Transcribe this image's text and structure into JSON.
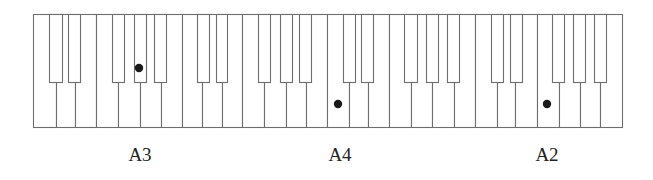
{
  "diagram": {
    "colors": {
      "background": "#ffffff",
      "key_fill": "#ffffff",
      "key_stroke": "#6e6e6e",
      "dot": "#1a1a1a",
      "label": "#222222"
    },
    "keyboard": {
      "top": 14,
      "bottom": 127,
      "black_key_bottom": 82,
      "white_key_edges": [
        33,
        56,
        75,
        96,
        118,
        140,
        161,
        182,
        202,
        222,
        242,
        264,
        286,
        306,
        327,
        349,
        368,
        389,
        411,
        432,
        454,
        475,
        497,
        515,
        537,
        559,
        580,
        600,
        622
      ],
      "black_keys": [
        {
          "x": 49,
          "w": 13
        },
        {
          "x": 68,
          "w": 12
        },
        {
          "x": 112,
          "w": 12
        },
        {
          "x": 134,
          "w": 12
        },
        {
          "x": 154,
          "w": 12
        },
        {
          "x": 197,
          "w": 12
        },
        {
          "x": 216,
          "w": 11
        },
        {
          "x": 258,
          "w": 12
        },
        {
          "x": 280,
          "w": 12
        },
        {
          "x": 299,
          "w": 12
        },
        {
          "x": 343,
          "w": 12
        },
        {
          "x": 361,
          "w": 12
        },
        {
          "x": 404,
          "w": 13
        },
        {
          "x": 426,
          "w": 12
        },
        {
          "x": 447,
          "w": 12
        },
        {
          "x": 491,
          "w": 12
        },
        {
          "x": 510,
          "w": 12
        },
        {
          "x": 552,
          "w": 12
        },
        {
          "x": 573,
          "w": 12
        },
        {
          "x": 594,
          "w": 12
        }
      ]
    },
    "markers": [
      {
        "name": "marker-dot-a3",
        "cx": 139,
        "cy": 68,
        "r": 4.2
      },
      {
        "name": "marker-dot-a4",
        "cx": 338,
        "cy": 104,
        "r": 4.2
      },
      {
        "name": "marker-dot-a2",
        "cx": 547,
        "cy": 104,
        "r": 4.2
      }
    ],
    "labels": [
      {
        "text": "A3",
        "x": 140
      },
      {
        "text": "A4",
        "x": 340
      },
      {
        "text": "A2",
        "x": 547
      }
    ]
  }
}
